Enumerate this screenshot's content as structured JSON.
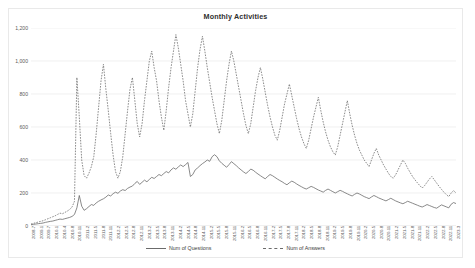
{
  "chart": {
    "title": "Monthly Activities",
    "legend": [
      {
        "label": "Num of Questions",
        "style": "solid"
      },
      {
        "label": "Num of Answers",
        "style": "dashed"
      }
    ]
  },
  "chart_data": {
    "type": "line",
    "title": "Monthly Activities",
    "xlabel": "",
    "ylabel": "",
    "ylim": [
      0,
      1200
    ],
    "yticks": [
      0,
      200,
      400,
      600,
      800,
      1000,
      1200
    ],
    "grid": true,
    "legend_position": "bottom",
    "line_color": "#6b6b6b",
    "x": [
      "2008-7",
      "2008-8",
      "2008-9",
      "2008-10",
      "2008-11",
      "2008-12",
      "2009-1",
      "2009-2",
      "2009-3",
      "2009-4",
      "2009-5",
      "2009-6",
      "2009-7",
      "2009-8",
      "2009-9",
      "2009-10",
      "2009-11",
      "2009-12",
      "2010-1",
      "2010-2",
      "2010-3",
      "2010-4",
      "2010-5",
      "2010-6",
      "2010-7",
      "2010-8",
      "2010-9",
      "2010-10",
      "2010-11",
      "2010-12",
      "2011-1",
      "2011-2",
      "2011-3",
      "2011-4",
      "2011-5",
      "2011-6",
      "2011-7",
      "2011-8",
      "2011-9",
      "2011-10",
      "2011-11",
      "2011-12",
      "2012-1",
      "2012-2",
      "2012-3",
      "2012-4",
      "2012-5",
      "2012-6",
      "2012-7",
      "2012-8",
      "2012-9",
      "2012-10",
      "2012-11",
      "2012-12",
      "2013-1",
      "2013-2",
      "2013-3",
      "2013-4",
      "2013-5",
      "2013-6",
      "2013-7",
      "2013-8",
      "2013-9",
      "2013-10",
      "2013-11",
      "2013-12",
      "2014-1",
      "2014-2",
      "2014-3",
      "2014-4",
      "2014-5",
      "2014-6",
      "2014-7",
      "2014-8",
      "2014-9",
      "2014-10",
      "2014-11",
      "2014-12",
      "2015-1",
      "2015-2",
      "2015-3",
      "2015-4",
      "2015-5",
      "2015-6",
      "2015-7",
      "2015-8",
      "2015-9",
      "2015-10",
      "2015-11",
      "2015-12",
      "2016-1",
      "2016-2",
      "2016-3",
      "2016-4",
      "2016-5",
      "2016-6",
      "2016-7",
      "2016-8",
      "2016-9",
      "2016-10",
      "2016-11",
      "2016-12",
      "2017-1",
      "2017-2",
      "2017-3",
      "2017-4",
      "2017-5",
      "2017-6",
      "2017-7",
      "2017-8",
      "2017-9",
      "2017-10",
      "2017-11",
      "2017-12",
      "2018-1",
      "2018-2",
      "2018-3",
      "2018-4",
      "2018-5",
      "2018-6",
      "2018-7",
      "2018-8",
      "2018-9",
      "2018-10",
      "2018-11",
      "2018-12",
      "2019-1",
      "2019-2",
      "2019-3",
      "2019-4",
      "2019-5",
      "2019-6",
      "2019-7",
      "2019-8",
      "2019-9",
      "2019-10",
      "2019-11",
      "2019-12",
      "2020-1",
      "2020-2",
      "2020-3",
      "2020-4",
      "2020-5",
      "2020-6",
      "2020-7",
      "2020-8",
      "2020-9",
      "2020-10",
      "2020-11",
      "2020-12",
      "2021-1",
      "2021-2",
      "2021-3",
      "2021-4",
      "2021-5",
      "2021-6",
      "2021-7",
      "2021-8",
      "2021-9",
      "2021-10",
      "2021-11",
      "2021-12",
      "2022-1",
      "2022-2",
      "2022-3",
      "2022-4",
      "2022-5",
      "2022-6",
      "2022-7",
      "2022-8",
      "2022-9",
      "2022-10",
      "2022-11",
      "2022-12",
      "2023-1",
      "2023-2",
      "2023-3"
    ],
    "xtick_labels": [
      "2008-7",
      "2009-1",
      "2009-7",
      "2010-1",
      "2010-4",
      "2010-8",
      "2010-11",
      "2011-2",
      "2011-5",
      "2011-8",
      "2011-11",
      "2012-2",
      "2012-5",
      "2012-8",
      "2012-11",
      "2013-2",
      "2013-5",
      "2013-8",
      "2013-11",
      "2014-2",
      "2014-5",
      "2014-8",
      "2014-11",
      "2015-2",
      "2015-5",
      "2015-8",
      "2015-11",
      "2016-2",
      "2016-5",
      "2016-8",
      "2016-11",
      "2017-2",
      "2017-5",
      "2017-8",
      "2017-11",
      "2018-2",
      "2018-5",
      "2018-8",
      "2018-11",
      "2019-2",
      "2019-5",
      "2019-8",
      "2019-11",
      "2020-2",
      "2020-5",
      "2020-8",
      "2020-11",
      "2021-2",
      "2021-5",
      "2021-8",
      "2021-11",
      "2022-2",
      "2022-5",
      "2022-8",
      "2022-11",
      "2023-3"
    ],
    "series": [
      {
        "name": "Num of Questions",
        "style": "solid",
        "values": [
          8,
          10,
          12,
          14,
          16,
          18,
          22,
          25,
          28,
          30,
          34,
          38,
          42,
          40,
          44,
          48,
          52,
          58,
          70,
          110,
          185,
          120,
          95,
          105,
          118,
          130,
          125,
          140,
          150,
          158,
          165,
          175,
          188,
          182,
          196,
          205,
          198,
          212,
          220,
          215,
          228,
          236,
          242,
          258,
          270,
          252,
          265,
          278,
          268,
          282,
          295,
          288,
          300,
          312,
          305,
          318,
          330,
          322,
          340,
          352,
          344,
          358,
          370,
          360,
          372,
          385,
          300,
          312,
          340,
          352,
          366,
          378,
          388,
          400,
          392,
          420,
          432,
          420,
          395,
          380,
          368,
          356,
          372,
          390,
          378,
          366,
          352,
          340,
          328,
          318,
          330,
          345,
          338,
          326,
          315,
          305,
          295,
          286,
          300,
          312,
          305,
          295,
          285,
          276,
          268,
          258,
          250,
          262,
          272,
          265,
          255,
          246,
          238,
          230,
          224,
          232,
          240,
          234,
          226,
          218,
          212,
          205,
          216,
          224,
          216,
          208,
          200,
          208,
          216,
          210,
          202,
          195,
          188,
          182,
          192,
          200,
          194,
          186,
          178,
          172,
          166,
          176,
          185,
          178,
          170,
          164,
          158,
          152,
          160,
          168,
          160,
          152,
          146,
          140,
          135,
          142,
          150,
          144,
          138,
          132,
          126,
          120,
          115,
          122,
          130,
          124,
          118,
          112,
          108,
          118,
          128,
          122,
          116,
          110,
          132,
          142,
          136
        ]
      },
      {
        "name": "Num of Answers",
        "style": "dashed",
        "values": [
          12,
          16,
          20,
          24,
          28,
          32,
          38,
          44,
          50,
          56,
          62,
          70,
          78,
          74,
          82,
          90,
          100,
          115,
          150,
          900,
          660,
          400,
          305,
          290,
          320,
          360,
          420,
          560,
          720,
          880,
          980,
          830,
          700,
          560,
          430,
          330,
          290,
          330,
          420,
          560,
          700,
          830,
          900,
          760,
          620,
          540,
          620,
          760,
          880,
          1000,
          1060,
          960,
          880,
          760,
          660,
          580,
          700,
          840,
          960,
          1060,
          1160,
          1080,
          980,
          880,
          760,
          680,
          600,
          680,
          820,
          960,
          1070,
          1150,
          1060,
          960,
          870,
          780,
          700,
          620,
          560,
          640,
          760,
          880,
          980,
          1060,
          1000,
          920,
          840,
          760,
          680,
          610,
          560,
          620,
          720,
          820,
          900,
          960,
          890,
          810,
          730,
          660,
          600,
          550,
          520,
          580,
          660,
          740,
          800,
          860,
          790,
          720,
          650,
          590,
          540,
          500,
          470,
          520,
          590,
          660,
          720,
          780,
          700,
          630,
          570,
          520,
          480,
          450,
          430,
          480,
          550,
          620,
          690,
          760,
          680,
          610,
          550,
          500,
          460,
          430,
          400,
          380,
          360,
          400,
          440,
          470,
          430,
          400,
          370,
          345,
          320,
          300,
          290,
          310,
          340,
          370,
          400,
          380,
          350,
          325,
          300,
          280,
          262,
          245,
          230,
          245,
          265,
          285,
          300,
          280,
          260,
          240,
          222,
          205,
          190,
          178,
          200,
          215,
          200
        ]
      }
    ]
  }
}
